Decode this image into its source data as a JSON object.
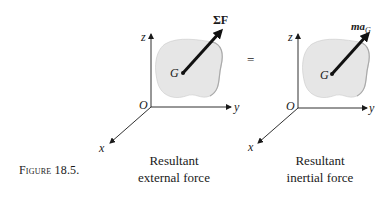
{
  "figure": {
    "label": "Figure 18.5.",
    "equals_sign": "="
  },
  "left_diagram": {
    "axes": {
      "z": "z",
      "y": "y",
      "x": "x",
      "origin": "O"
    },
    "point": "G",
    "vector_label": "ΣF",
    "caption_line1": "Resultant",
    "caption_line2": "external force"
  },
  "right_diagram": {
    "axes": {
      "z": "z",
      "y": "y",
      "x": "x",
      "origin": "O"
    },
    "point": "G",
    "vector_label_main": "ma",
    "vector_label_sub": "G",
    "caption_line1": "Resultant",
    "caption_line2": "inertial force"
  },
  "colors": {
    "ink": "#1a1a1a",
    "blob_fill": "#e6e6e6",
    "blob_edge": "#b8b8b8",
    "background": "#ffffff"
  }
}
